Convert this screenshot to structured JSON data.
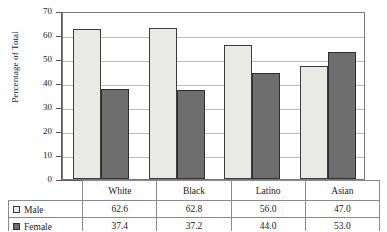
{
  "chart_data": {
    "type": "bar",
    "title": "",
    "xlabel": "",
    "ylabel": "Percentage of Total",
    "ylim": [
      0,
      70
    ],
    "ytick_step": 10,
    "yticks": [
      70,
      60,
      50,
      40,
      30,
      20,
      10,
      0
    ],
    "grid": "horizontal",
    "legend_position": "table-left",
    "categories": [
      "White",
      "Black",
      "Latino",
      "Asian"
    ],
    "series": [
      {
        "name": "Male",
        "values": [
          62.6,
          62.8,
          56.0,
          47.0
        ],
        "color": "#e9e9e6"
      },
      {
        "name": "Female",
        "values": [
          37.4,
          37.2,
          44.0,
          53.0
        ],
        "color": "#6e6e6e"
      }
    ]
  },
  "table": {
    "header": [
      "",
      "White",
      "Black",
      "Latino",
      "Asian"
    ],
    "rows": [
      {
        "label": "Male",
        "swatch": "male-swatch",
        "cells": [
          "62.6",
          "62.8",
          "56.0",
          "47.0"
        ]
      },
      {
        "label": "Female",
        "swatch": "female-swatch",
        "cells": [
          "37.4",
          "37.2",
          "44.0",
          "53.0"
        ]
      }
    ]
  },
  "colors": {
    "male": "#e9e9e6",
    "female": "#6e6e6e",
    "grid": "#b9b9b9",
    "axis": "#5a5a5a",
    "border": "#8a8a8a"
  }
}
